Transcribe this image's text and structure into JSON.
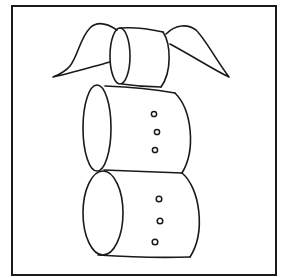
{
  "figure": {
    "colors": {
      "background": "#ffffff",
      "ink": "#1a1a1a"
    },
    "parts": {
      "head": {
        "label": "head cylinder with pigtails"
      },
      "middle": {
        "label": "middle body cylinder",
        "button_count": 3
      },
      "bottom": {
        "label": "bottom body cylinder",
        "button_count": 3
      }
    }
  }
}
